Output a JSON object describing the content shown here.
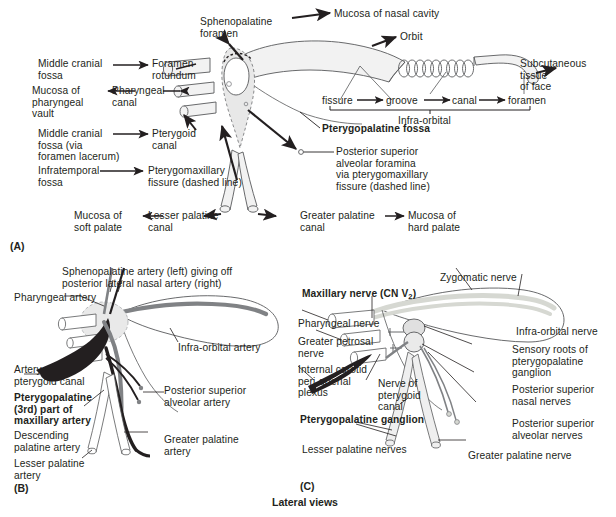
{
  "figure": {
    "caption": "Lateral views",
    "panels": [
      {
        "id": "A",
        "label": "(A)"
      },
      {
        "id": "B",
        "label": "(B)"
      },
      {
        "id": "C",
        "label": "(C)"
      }
    ]
  },
  "panelA": {
    "title": "Pterygopalatine fossa — bony communications",
    "labels": {
      "sphenopalatine_foramen": "Sphenopalatine\nforamen",
      "mucosa_nasal_cavity": "Mucosa of nasal cavity",
      "orbit": "Orbit",
      "middle_cranial_fossa": "Middle cranial\nfossa",
      "foramen_rotundum": "Foramen\nrotundum",
      "mucosa_pharyngeal_vault": "Mucosa of\npharyngeal\nvault",
      "pharyngeal_canal": "Pharyngeal\ncanal",
      "middle_cranial_fossa_lacerum": "Middle cranial\nfossa (via\nforamen lacerum)",
      "pterygoid_canal": "Pterygoid\ncanal",
      "infratemporal_fossa": "Infratemporal\nfossa",
      "pterygomaxillary_fissure": "Pterygomaxillary\nfissure (dashed line)",
      "mucosa_soft_palate": "Mucosa of\nsoft palate",
      "lesser_palatine_canal": "Lesser palatine\ncanal",
      "greater_palatine_canal": "Greater palatine\ncanal",
      "mucosa_hard_palate": "Mucosa of\nhard palate",
      "subcutaneous_tissue_face": "Subcutaneous\ntissue\nof face",
      "pterygopalatine_fossa": "Pterygopalatine fossa",
      "posterior_superior_alveolar_foramina": "Posterior superior\nalveolar foramina\nvia pterygomaxillary\nfissure (dashed line)"
    },
    "infraorbital_chain": {
      "items": [
        "fissure",
        "groove",
        "canal",
        "foramen"
      ],
      "bracket_label": "Infra-orbital"
    }
  },
  "panelB": {
    "title": "Arteries of the pterygopalatine fossa",
    "labels": {
      "sphenopalatine_artery": "Sphenopalatine artery (left) giving off\nposterior lateral nasal artery (right)",
      "pharyngeal_artery": "Pharyngeal artery",
      "infraorbital_artery": "Infra-orbital artery",
      "artery_of_pterygoid_canal": "Artery of\npterygoid canal",
      "posterior_superior_alveolar_artery": "Posterior superior\nalveolar artery",
      "pterygopalatine_maxillary_artery": "Pterygopalatine\n(3rd) part of\nmaxillary artery",
      "descending_palatine_artery": "Descending\npalatine artery",
      "greater_palatine_artery": "Greater palatine\nartery",
      "lesser_palatine_artery": "Lesser palatine\nartery"
    }
  },
  "panelC": {
    "title": "Nerves of the pterygopalatine fossa",
    "labels": {
      "maxillary_nerve": "Maxillary nerve (CN V",
      "maxillary_nerve_sub": "2",
      "maxillary_nerve_end": ")",
      "zygomatic_nerve": "Zygomatic nerve",
      "pharyngeal_nerve": "Pharyngeal nerve",
      "greater_petrosal_nerve": "Greater petrosal\nnerve",
      "internal_carotid_plexus": "Internal carotid\nperi-arterial\nplexus",
      "nerve_of_pterygoid_canal": "Nerve of\npterygoid\ncanal",
      "pterygopalatine_ganglion": "Pterygopalatine ganglion",
      "lesser_palatine_nerves": "Lesser palatine nerves",
      "infraorbital_nerve": "Infra-orbital nerve",
      "sensory_roots": "Sensory roots of\npterygopalatine\nganglion",
      "posterior_superior_nasal_nerves": "Posterior superior\nnasal nerves",
      "posterior_superior_alveolar_nerves": "Posterior superior\nalveolar nerves",
      "greater_palatine_nerve": "Greater palatine nerve"
    }
  },
  "colors": {
    "ink": "#231f20",
    "bone_fill": "#f2f2f2",
    "bone_stroke": "#58595b",
    "fossa_fill": "#d9d9d9",
    "fossa_stroke": "#6d6e71",
    "artery_dark": "#231f20",
    "artery_gray": "#808285",
    "nerve_light": "#d6d8d2",
    "nerve_stroke": "#808285"
  }
}
